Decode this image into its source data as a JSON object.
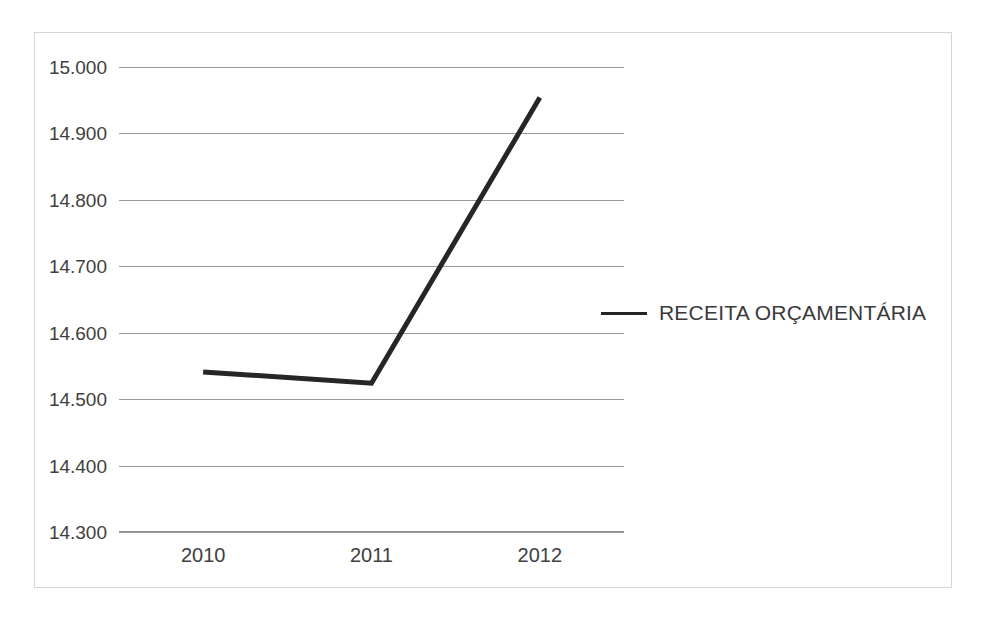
{
  "chart_data": {
    "type": "line",
    "title": "",
    "subtitle": "",
    "xlabel": "",
    "ylabel": "",
    "categories": [
      "2010",
      "2011",
      "2012"
    ],
    "series": [
      {
        "name": "RECEITA ORÇAMENTÁRIA",
        "values": [
          14541,
          14524,
          14954
        ],
        "color": "#262626"
      }
    ],
    "ylim": [
      14300,
      15000
    ],
    "ytick_labels": [
      "15.000",
      "14.900",
      "14.800",
      "14.700",
      "14.600",
      "14.500",
      "14.400",
      "14.300"
    ],
    "ytick_values": [
      15000,
      14900,
      14800,
      14700,
      14600,
      14500,
      14400,
      14300
    ],
    "grid": true,
    "grid_color": "#9a9a9a",
    "legend_position": "right",
    "legend": [
      {
        "label": "RECEITA ORÇAMENTÁRIA",
        "color": "#262626"
      }
    ],
    "border_color": "#d6d6d6",
    "background": "#ffffff"
  }
}
